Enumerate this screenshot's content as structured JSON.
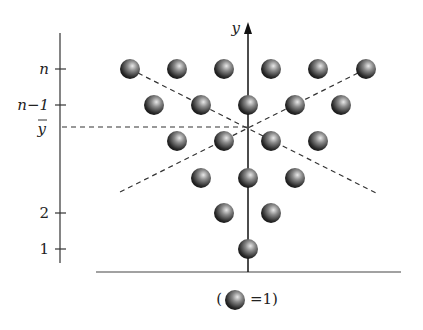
{
  "diagram": {
    "y_axis_label": "y",
    "left_axis_ticks": [
      {
        "label": "n",
        "y": 69,
        "italic": true
      },
      {
        "label": "n−1",
        "y": 105,
        "italic": true
      },
      {
        "label": "y̅",
        "y": 127,
        "italic": true
      },
      {
        "label": "2",
        "y": 213,
        "italic": false
      },
      {
        "label": "1",
        "y": 249,
        "italic": false
      }
    ],
    "ybar_label": "y",
    "legend": {
      "open": "(",
      "text": "=1)"
    },
    "ball_rows": [
      {
        "y": 69,
        "xs": [
          130,
          177,
          224,
          271,
          318,
          366
        ]
      },
      {
        "y": 105,
        "xs": [
          154,
          201,
          248,
          295,
          341
        ]
      },
      {
        "y": 141,
        "xs": [
          177,
          224,
          271,
          318
        ]
      },
      {
        "y": 178,
        "xs": [
          201,
          248,
          295
        ]
      },
      {
        "y": 213,
        "xs": [
          224,
          271
        ]
      },
      {
        "y": 249,
        "xs": [
          248
        ]
      }
    ],
    "colors": {
      "ball_dark": "#1a1a1a",
      "ball_light": "#cfcfcf",
      "line": "#222222"
    }
  }
}
